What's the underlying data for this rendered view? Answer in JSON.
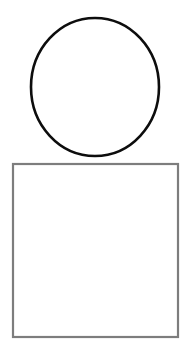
{
  "canvas": {
    "width": 190,
    "height": 355,
    "background_color": "#ffffff",
    "title": ""
  },
  "shapes": [
    {
      "id": "circle",
      "name": "circle-shape",
      "kind": "ellipse",
      "label": "",
      "center_x": 95,
      "center_y": 87,
      "radius_x": 64,
      "radius_y": 69,
      "bounds": {
        "left": 31,
        "top": 18,
        "width": 128,
        "height": 138
      },
      "stroke_color": "#0d0d0d",
      "stroke_width": 2.6,
      "fill_color": "none"
    },
    {
      "id": "square",
      "name": "square-shape",
      "kind": "rect",
      "label": "",
      "bounds": {
        "left": 13,
        "top": 164,
        "width": 165,
        "height": 173
      },
      "stroke_color": "#7d7d7d",
      "stroke_width": 2.2,
      "fill_color": "none"
    }
  ]
}
